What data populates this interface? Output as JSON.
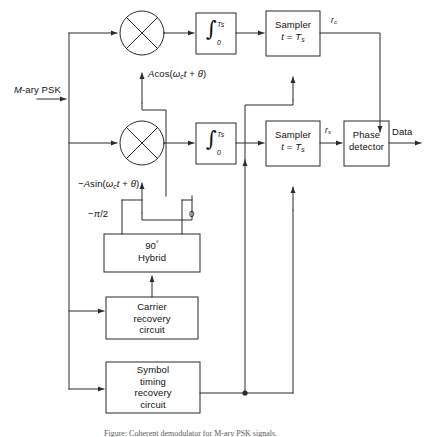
{
  "figure": {
    "caption": "Figure: Coherent demodulator for M-ary PSK signals."
  },
  "colors": {
    "line": "#2b2b2b",
    "text": "#111111",
    "background": "#ffffff"
  },
  "signals": {
    "input_label": "M-ary PSK",
    "carrier_inphase": "Acos(ωct + θ)",
    "carrier_quadrature": "−Asin(ωct + θ)",
    "node_rc": "rc",
    "node_rs": "rs",
    "output_label": "Data",
    "phase_minus_pi_over_2": "−π/2",
    "phase_zero": "0"
  },
  "blocks": {
    "integrator_inphase": {
      "name": "integrator",
      "symbol": "∫",
      "upper_limit": "Ts",
      "lower_limit": "0"
    },
    "integrator_quadrature": {
      "name": "integrator",
      "symbol": "∫",
      "upper_limit": "Ts",
      "lower_limit": "0"
    },
    "sampler_inphase": {
      "line1": "Sampler",
      "line2": "t = Ts"
    },
    "sampler_quadrature": {
      "line1": "Sampler",
      "line2": "t = Ts"
    },
    "phase_detector": {
      "line1": "Phase",
      "line2": "detector"
    },
    "hybrid": {
      "line1": "90°",
      "line2": "Hybrid"
    },
    "carrier_recovery": {
      "line1": "Carrier",
      "line2": "recovery",
      "line3": "circuit"
    },
    "symbol_timing_recovery": {
      "line1": "Symbol",
      "line2": "timing",
      "line3": "recovery",
      "line4": "circuit"
    }
  },
  "mixers": {
    "inphase_name": "multiplier",
    "quadrature_name": "multiplier"
  }
}
